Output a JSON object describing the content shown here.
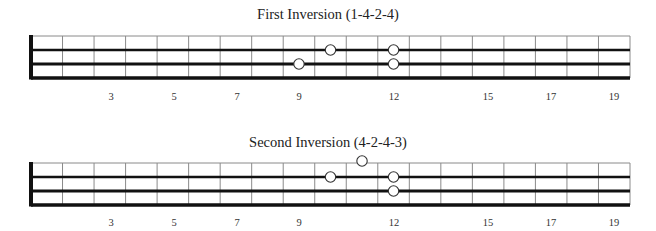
{
  "diagrams": [
    {
      "title": "First Inversion (1-4-2-4)",
      "fret_numbers": [
        "3",
        "5",
        "7",
        "9",
        "12",
        "15",
        "17",
        "19"
      ],
      "notes": [
        {
          "fret": 10,
          "string": 1
        },
        {
          "fret": 12,
          "string": 1
        },
        {
          "fret": 9,
          "string": 2
        },
        {
          "fret": 12,
          "string": 2
        }
      ]
    },
    {
      "title": "Second Inversion (4-2-4-3)",
      "fret_numbers": [
        "3",
        "5",
        "7",
        "9",
        "12",
        "15",
        "17",
        "19"
      ],
      "notes": [
        {
          "fret": 11,
          "string": 0
        },
        {
          "fret": 10,
          "string": 1
        },
        {
          "fret": 12,
          "string": 1
        },
        {
          "fret": 12,
          "string": 2
        }
      ]
    }
  ],
  "colors": {
    "line": "#111111",
    "fret": "#8a8a8a",
    "background": "#ffffff"
  }
}
